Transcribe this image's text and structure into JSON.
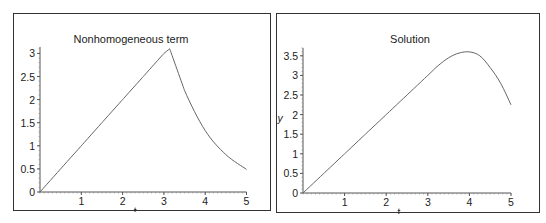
{
  "chart_data": [
    {
      "type": "line",
      "title": "Nonhomogeneous term",
      "xlabel": "t",
      "ylabel": "",
      "xlim": [
        0,
        5
      ],
      "ylim": [
        0,
        3.14
      ],
      "xticks": [
        "1",
        "2",
        "3",
        "4",
        "5"
      ],
      "yticks": [
        "0",
        "0.5",
        "1",
        "1.5",
        "2",
        "2.5",
        "3"
      ],
      "origin_label": "0",
      "grid": false,
      "series": [
        {
          "name": "nonhomogeneous term",
          "x": [
            0,
            0.5,
            1,
            1.5,
            2,
            2.5,
            3,
            3.14,
            3.5,
            4,
            4.5,
            5
          ],
          "values": [
            0,
            0.5,
            1,
            1.5,
            2,
            2.5,
            3,
            3.1,
            2.2,
            1.33,
            0.81,
            0.49
          ]
        }
      ]
    },
    {
      "type": "line",
      "title": "Solution",
      "xlabel": "t",
      "ylabel": "y",
      "xlim": [
        0,
        5
      ],
      "ylim": [
        0,
        3.7
      ],
      "xticks": [
        "1",
        "2",
        "3",
        "4",
        "5"
      ],
      "yticks": [
        "0",
        "0.5",
        "1",
        "1.5",
        "2",
        "2.5",
        "3",
        "3.5"
      ],
      "origin_label": "0",
      "grid": false,
      "series": [
        {
          "name": "solution",
          "x": [
            0,
            0.5,
            1,
            1.5,
            2,
            2.5,
            3,
            3.25,
            3.5,
            3.75,
            4,
            4.25,
            4.5,
            4.75,
            5
          ],
          "values": [
            0,
            0.5,
            1,
            1.5,
            2,
            2.5,
            3,
            3.25,
            3.45,
            3.57,
            3.6,
            3.5,
            3.2,
            2.8,
            2.25
          ]
        }
      ]
    }
  ]
}
